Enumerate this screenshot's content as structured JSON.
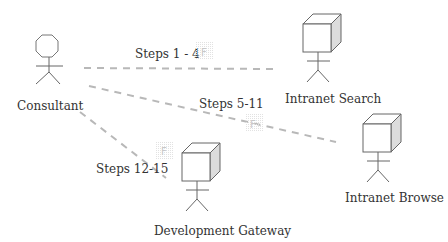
{
  "diagram": {
    "type": "use-case-interaction",
    "colors": {
      "line": "#b8b8b8",
      "stroke": "#666666",
      "text": "#333333",
      "cube_side": "#dddddd",
      "badge_grid": "#e6e6e6",
      "badge_text": "#c8c8c8"
    },
    "actors": [
      {
        "id": "consultant",
        "label": "Consultant",
        "shape": "octagon-head-stick-figure"
      },
      {
        "id": "intranet-search",
        "label": "Intranet Search",
        "shape": "cube-head-stick-figure"
      },
      {
        "id": "intranet-browse",
        "label": "Intranet Browse",
        "shape": "cube-head-stick-figure"
      },
      {
        "id": "development-gateway",
        "label": "Development Gateway",
        "shape": "cube-head-stick-figure"
      }
    ],
    "connections": [
      {
        "from": "consultant",
        "to": "intranet-search",
        "label": "Steps 1 - 4",
        "badge": "F",
        "style": "dashed"
      },
      {
        "from": "consultant",
        "to": "intranet-browse",
        "label": "Steps 5-11",
        "badge": "F",
        "style": "dashed"
      },
      {
        "from": "consultant",
        "to": "development-gateway",
        "label": "Steps 12-15",
        "badge": "F",
        "style": "dashed"
      }
    ]
  }
}
